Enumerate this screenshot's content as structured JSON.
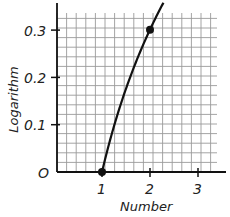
{
  "chart_data": {
    "type": "line",
    "title": "",
    "xlabel": "Number",
    "ylabel": "Logarithm",
    "xlim": [
      0,
      3.5
    ],
    "ylim": [
      0,
      0.33
    ],
    "grid": true,
    "x_ticks": [
      "1",
      "2",
      "3"
    ],
    "y_ticks": [
      "0.1",
      "0.2",
      "0.3"
    ],
    "origin_label": "O",
    "series": [
      {
        "name": "log10(x)",
        "x": [
          1.0,
          1.25,
          1.5,
          1.75,
          2.0,
          2.25
        ],
        "y": [
          0.0,
          0.097,
          0.176,
          0.243,
          0.301,
          0.352
        ]
      }
    ],
    "marked_points": [
      {
        "x": 1,
        "y": 0
      },
      {
        "x": 2,
        "y": 0.301
      }
    ]
  },
  "labels": {
    "x1": "1",
    "x2": "2",
    "x3": "3",
    "y1": "0.1",
    "y2": "0.2",
    "y3": "0.3",
    "origin": "O",
    "xlabel": "Number",
    "ylabel": "Logarithm"
  },
  "colors": {
    "grid": "#9a9a9a",
    "axis": "#111111",
    "curve": "#111111"
  }
}
